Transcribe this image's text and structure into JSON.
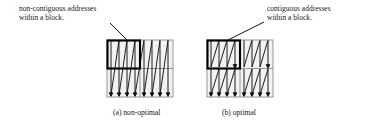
{
  "figure": {
    "annotations": [
      {
        "id": "non-contiguous",
        "line1": "non-contiguous addresses",
        "line2": "within a block."
      },
      {
        "id": "contiguous",
        "line1": "contiguous addresses",
        "line2": "within a block."
      }
    ],
    "captions": [
      {
        "id": "a",
        "text": "(a) non-optimal"
      },
      {
        "id": "b",
        "text": "(b) optimal"
      }
    ],
    "colors": {
      "panel_fill": "#f2f2f2",
      "panel_border": "#8c8c8c",
      "scan_path": "#111111",
      "block_outline": "#000000",
      "background": "#ffffff",
      "text": "#161616"
    },
    "diagrams": [
      {
        "id": "non-optimal",
        "label": "(a) non-optimal",
        "grid": {
          "rows": 2,
          "cols": 2
        },
        "scan_order": "column-major full-height serpentine",
        "block_region": "top-left quadrant",
        "scan_columns": 8,
        "block_spans_scan": true
      },
      {
        "id": "optimal",
        "label": "(b) optimal",
        "grid": {
          "rows": 2,
          "cols": 2
        },
        "scan_order": "blocked serpentine within each quadrant",
        "block_region": "top-left quadrant",
        "scan_columns": 8,
        "block_spans_scan": false
      }
    ]
  }
}
